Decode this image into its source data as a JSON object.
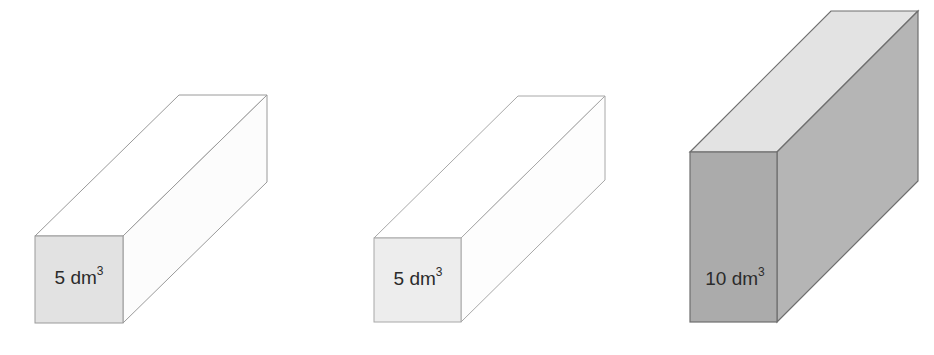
{
  "figure": {
    "background_color": "#ffffff",
    "width": 934,
    "height": 355
  },
  "prisms": [
    {
      "id": "prism-1",
      "label_value": "5",
      "label_unit": "dm",
      "label_exponent": "3",
      "label_full": "5 dm3",
      "front_face_color": "#e2e2e2",
      "top_face_color": "#ffffff",
      "side_face_color": "#fcfcfc",
      "edge_color": "#9a9a9a",
      "geometry": {
        "front": {
          "left": 35,
          "top": 236,
          "right": 123,
          "bottom": 323
        },
        "depth_dx": 144,
        "depth_dy": -141
      }
    },
    {
      "id": "prism-2",
      "label_value": "5",
      "label_unit": "dm",
      "label_exponent": "3",
      "label_full": "5 dm3",
      "front_face_color": "#ededed",
      "top_face_color": "#ffffff",
      "side_face_color": "#fdfdfd",
      "edge_color": "#a8a8a8",
      "geometry": {
        "front": {
          "left": 374,
          "top": 238,
          "right": 461,
          "bottom": 322
        },
        "depth_dx": 144,
        "depth_dy": -142
      }
    },
    {
      "id": "prism-3",
      "label_value": "10",
      "label_unit": "dm",
      "label_exponent": "3",
      "label_full": "10 dm3",
      "front_face_color": "#ababab",
      "top_face_color": "#e3e3e3",
      "side_face_color": "#b5b5b5",
      "edge_color": "#6e6e6e",
      "geometry": {
        "front": {
          "left": 690,
          "top": 152,
          "right": 777,
          "bottom": 322
        },
        "depth_dx": 141,
        "depth_dy": -141
      }
    }
  ]
}
